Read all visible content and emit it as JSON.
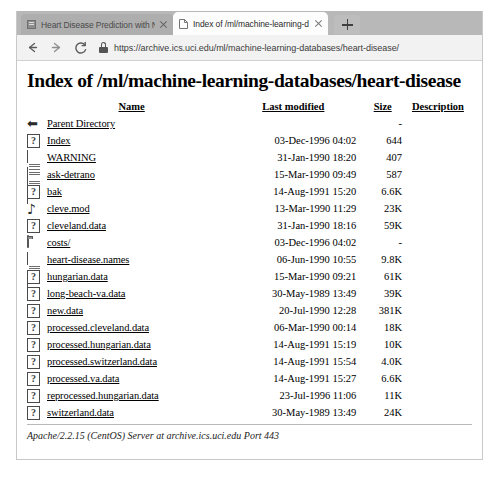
{
  "browser": {
    "tabs": [
      {
        "title": "Heart Disease Prediction with Ne",
        "favicon": "generic-page-icon",
        "active": false
      },
      {
        "title": "Index of /ml/machine-learning-d",
        "favicon": "document-icon",
        "active": true
      }
    ],
    "new_tab_label": "+",
    "toolbar": {
      "back_label": "Back",
      "forward_label": "Forward",
      "reload_label": "C",
      "lock_icon": "lock-icon",
      "url": "https://archive.ics.uci.edu/ml/machine-learning-databases/heart-disease/"
    }
  },
  "page": {
    "title": "Index of /ml/machine-learning-databases/heart-disease",
    "columns": [
      "Name",
      "Last modified",
      "Size",
      "Description"
    ],
    "rows": [
      {
        "icon": "back-icon",
        "name": "Parent Directory",
        "modified": "",
        "size": "-",
        "description": ""
      },
      {
        "icon": "unknown-icon",
        "name": "Index",
        "modified": "03-Dec-1996 04:02",
        "size": "644",
        "description": ""
      },
      {
        "icon": "text-icon",
        "name": "WARNING",
        "modified": "31-Jan-1990 18:20",
        "size": "407",
        "description": ""
      },
      {
        "icon": "text-icon",
        "name": "ask-detrano",
        "modified": "15-Mar-1990 09:49",
        "size": "587",
        "description": ""
      },
      {
        "icon": "unknown-icon",
        "name": "bak",
        "modified": "14-Aug-1991 15:20",
        "size": "6.6K",
        "description": ""
      },
      {
        "icon": "sound-icon",
        "name": "cleve.mod",
        "modified": "13-Mar-1990 11:29",
        "size": "23K",
        "description": ""
      },
      {
        "icon": "unknown-icon",
        "name": "cleveland.data",
        "modified": "31-Jan-1990 18:16",
        "size": "59K",
        "description": ""
      },
      {
        "icon": "folder-icon",
        "name": "costs/",
        "modified": "03-Dec-1996 04:02",
        "size": "-",
        "description": ""
      },
      {
        "icon": "text-icon",
        "name": "heart-disease.names",
        "modified": "06-Jun-1990 10:55",
        "size": "9.8K",
        "description": ""
      },
      {
        "icon": "unknown-icon",
        "name": "hungarian.data",
        "modified": "15-Mar-1990 09:21",
        "size": "61K",
        "description": ""
      },
      {
        "icon": "unknown-icon",
        "name": "long-beach-va.data",
        "modified": "30-May-1989 13:49",
        "size": "39K",
        "description": ""
      },
      {
        "icon": "unknown-icon",
        "name": "new.data",
        "modified": "20-Jul-1990 12:28",
        "size": "381K",
        "description": ""
      },
      {
        "icon": "unknown-icon",
        "name": "processed.cleveland.data",
        "modified": "06-Mar-1990 00:14",
        "size": "18K",
        "description": ""
      },
      {
        "icon": "unknown-icon",
        "name": "processed.hungarian.data",
        "modified": "14-Aug-1991 15:19",
        "size": "10K",
        "description": ""
      },
      {
        "icon": "unknown-icon",
        "name": "processed.switzerland.data",
        "modified": "14-Aug-1991 15:54",
        "size": "4.0K",
        "description": ""
      },
      {
        "icon": "unknown-icon",
        "name": "processed.va.data",
        "modified": "14-Aug-1991 15:27",
        "size": "6.6K",
        "description": ""
      },
      {
        "icon": "unknown-icon",
        "name": "reprocessed.hungarian.data",
        "modified": "23-Jul-1996 11:06",
        "size": "11K",
        "description": ""
      },
      {
        "icon": "unknown-icon",
        "name": "switzerland.data",
        "modified": "30-May-1989 13:49",
        "size": "24K",
        "description": ""
      }
    ],
    "footer": "Apache/2.2.15 (CentOS) Server at archive.ics.uci.edu Port 443"
  },
  "colors": {
    "tabstrip": "#b8b8b8",
    "toolbar": "#f2f2f2",
    "page_bg": "#ffffff",
    "text": "#000000"
  }
}
